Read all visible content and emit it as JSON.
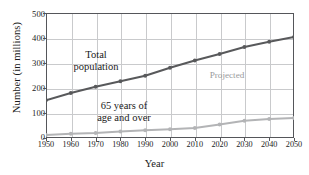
{
  "chart_data": {
    "type": "line",
    "title": "",
    "xlabel": "Year",
    "ylabel": "Number (in millions)",
    "x": [
      1950,
      1960,
      1970,
      1980,
      1990,
      2000,
      2010,
      2020,
      2030,
      2040,
      2050
    ],
    "xticklabels": [
      "1950",
      "1960",
      "1970",
      "1980",
      "1990",
      "2000",
      "2010",
      "2020",
      "2030",
      "2040",
      "2050"
    ],
    "yticklabels": [
      "0",
      "100",
      "200",
      "300",
      "400",
      "500"
    ],
    "yticks": [
      0,
      100,
      200,
      300,
      400,
      500
    ],
    "xlim": [
      1950,
      2050
    ],
    "ylim": [
      0,
      500
    ],
    "grid": true,
    "legend_position": "none",
    "series": [
      {
        "name": "Total population",
        "color": "#58595b",
        "values": [
          151,
          180,
          205,
          227,
          249,
          281,
          310,
          336,
          364,
          385,
          404
        ]
      },
      {
        "name": "65 years of age and over",
        "color": "#b3b4b6",
        "values": [
          12,
          17,
          20,
          26,
          31,
          35,
          40,
          54,
          69,
          76,
          80
        ]
      }
    ],
    "annotations": [
      {
        "name": "total-population",
        "text": "Total\npopulation",
        "line1": "Total",
        "line2": "population"
      },
      {
        "name": "age-65-and-over",
        "text": "65 years of\nage and over",
        "line1": "65 years of",
        "line2": "age and over"
      },
      {
        "name": "projected",
        "text": "Projected"
      }
    ]
  },
  "axes": {
    "x_title": "Year",
    "y_title": "Number (in millions)"
  },
  "annotations": {
    "total_line1": "Total",
    "total_line2": "population",
    "age65_line1": "65 years of",
    "age65_line2": "age and over",
    "projected": "Projected"
  },
  "yticks": {
    "t0": "0",
    "t1": "100",
    "t2": "200",
    "t3": "300",
    "t4": "400",
    "t5": "500"
  },
  "xticks": {
    "t0": "1950",
    "t1": "1960",
    "t2": "1970",
    "t3": "1980",
    "t4": "1990",
    "t5": "2000",
    "t6": "2010",
    "t7": "2020",
    "t8": "2030",
    "t9": "2040",
    "t10": "2050"
  },
  "colors": {
    "total_series": "#58595b",
    "age65_series": "#b3b4b6",
    "grid": "#c9cacc",
    "frame": "#55565a",
    "projected_label": "#9a9b9d"
  }
}
